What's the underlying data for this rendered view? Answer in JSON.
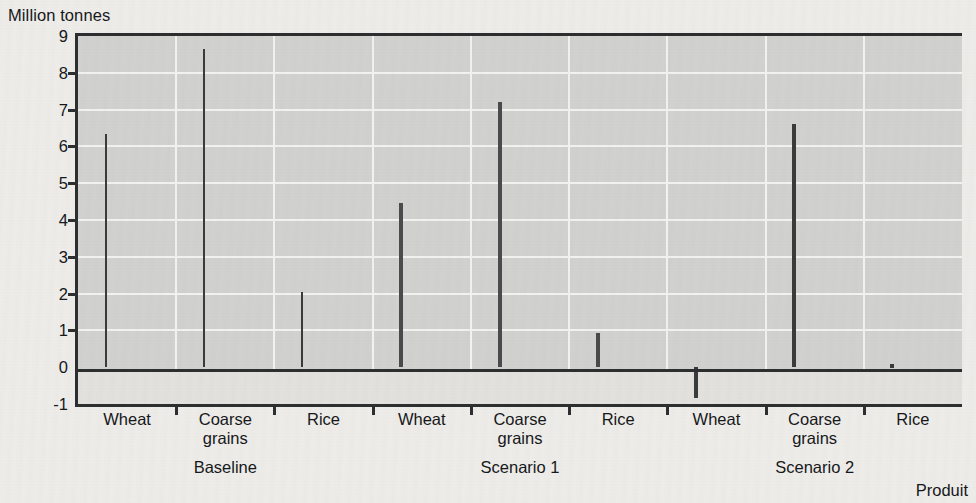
{
  "chart_data": {
    "type": "bar",
    "title": "",
    "ylabel": "Million tonnes",
    "xlabel": "Produit",
    "ylim": [
      -1,
      9
    ],
    "yticks": [
      9,
      8,
      7,
      6,
      5,
      4,
      3,
      2,
      1,
      0,
      -1
    ],
    "ytick_labels": [
      "9",
      "8",
      "7",
      "6",
      "5",
      "4",
      "3",
      "2",
      "1",
      "0",
      "-1"
    ],
    "grid": true,
    "legend": "none",
    "categories": [
      "Wheat",
      "Coarse grains",
      "Rice"
    ],
    "groups": [
      "Baseline",
      "Scenario 1",
      "Scenario 2"
    ],
    "series": [
      {
        "name": "Baseline",
        "color": "#4a4b4d",
        "values": [
          6.35,
          8.65,
          2.03
        ]
      },
      {
        "name": "Scenario 1",
        "color": "#d6d6d4",
        "values": [
          4.45,
          7.2,
          0.93
        ]
      },
      {
        "name": "Scenario 2",
        "color": "#8e8f8d",
        "values": [
          -0.83,
          6.6,
          0.1
        ]
      }
    ],
    "bars": [
      {
        "group": "Baseline",
        "category": "Wheat",
        "label": "Wheat",
        "value": 6.35,
        "series": "baseline"
      },
      {
        "group": "Baseline",
        "category": "Coarse grains",
        "label": "Coarse\ngrains",
        "value": 8.65,
        "series": "baseline"
      },
      {
        "group": "Baseline",
        "category": "Rice",
        "label": "Rice",
        "value": 2.03,
        "series": "baseline"
      },
      {
        "group": "Scenario 1",
        "category": "Wheat",
        "label": "Wheat",
        "value": 4.45,
        "series": "scenario1"
      },
      {
        "group": "Scenario 1",
        "category": "Coarse grains",
        "label": "Coarse\ngrains",
        "value": 7.2,
        "series": "scenario1"
      },
      {
        "group": "Scenario 1",
        "category": "Rice",
        "label": "Rice",
        "value": 0.93,
        "series": "scenario1"
      },
      {
        "group": "Scenario 2",
        "category": "Wheat",
        "label": "Wheat",
        "value": -0.83,
        "series": "scenario2"
      },
      {
        "group": "Scenario 2",
        "category": "Coarse grains",
        "label": "Coarse\ngrains",
        "value": 6.6,
        "series": "scenario2"
      },
      {
        "group": "Scenario 2",
        "category": "Rice",
        "label": "Rice",
        "value": 0.1,
        "series": "scenario2"
      }
    ]
  },
  "axis": {
    "y_title": "Million tonnes",
    "x_title": "Produit"
  },
  "category_labels": [
    {
      "line1": "Wheat",
      "line2": ""
    },
    {
      "line1": "Coarse",
      "line2": "grains"
    },
    {
      "line1": "Rice",
      "line2": ""
    },
    {
      "line1": "Wheat",
      "line2": ""
    },
    {
      "line1": "Coarse",
      "line2": "grains"
    },
    {
      "line1": "Rice",
      "line2": ""
    },
    {
      "line1": "Wheat",
      "line2": ""
    },
    {
      "line1": "Coarse",
      "line2": "grains"
    },
    {
      "line1": "Rice",
      "line2": ""
    }
  ],
  "group_labels": [
    "Baseline",
    "Scenario 1",
    "Scenario 2"
  ]
}
